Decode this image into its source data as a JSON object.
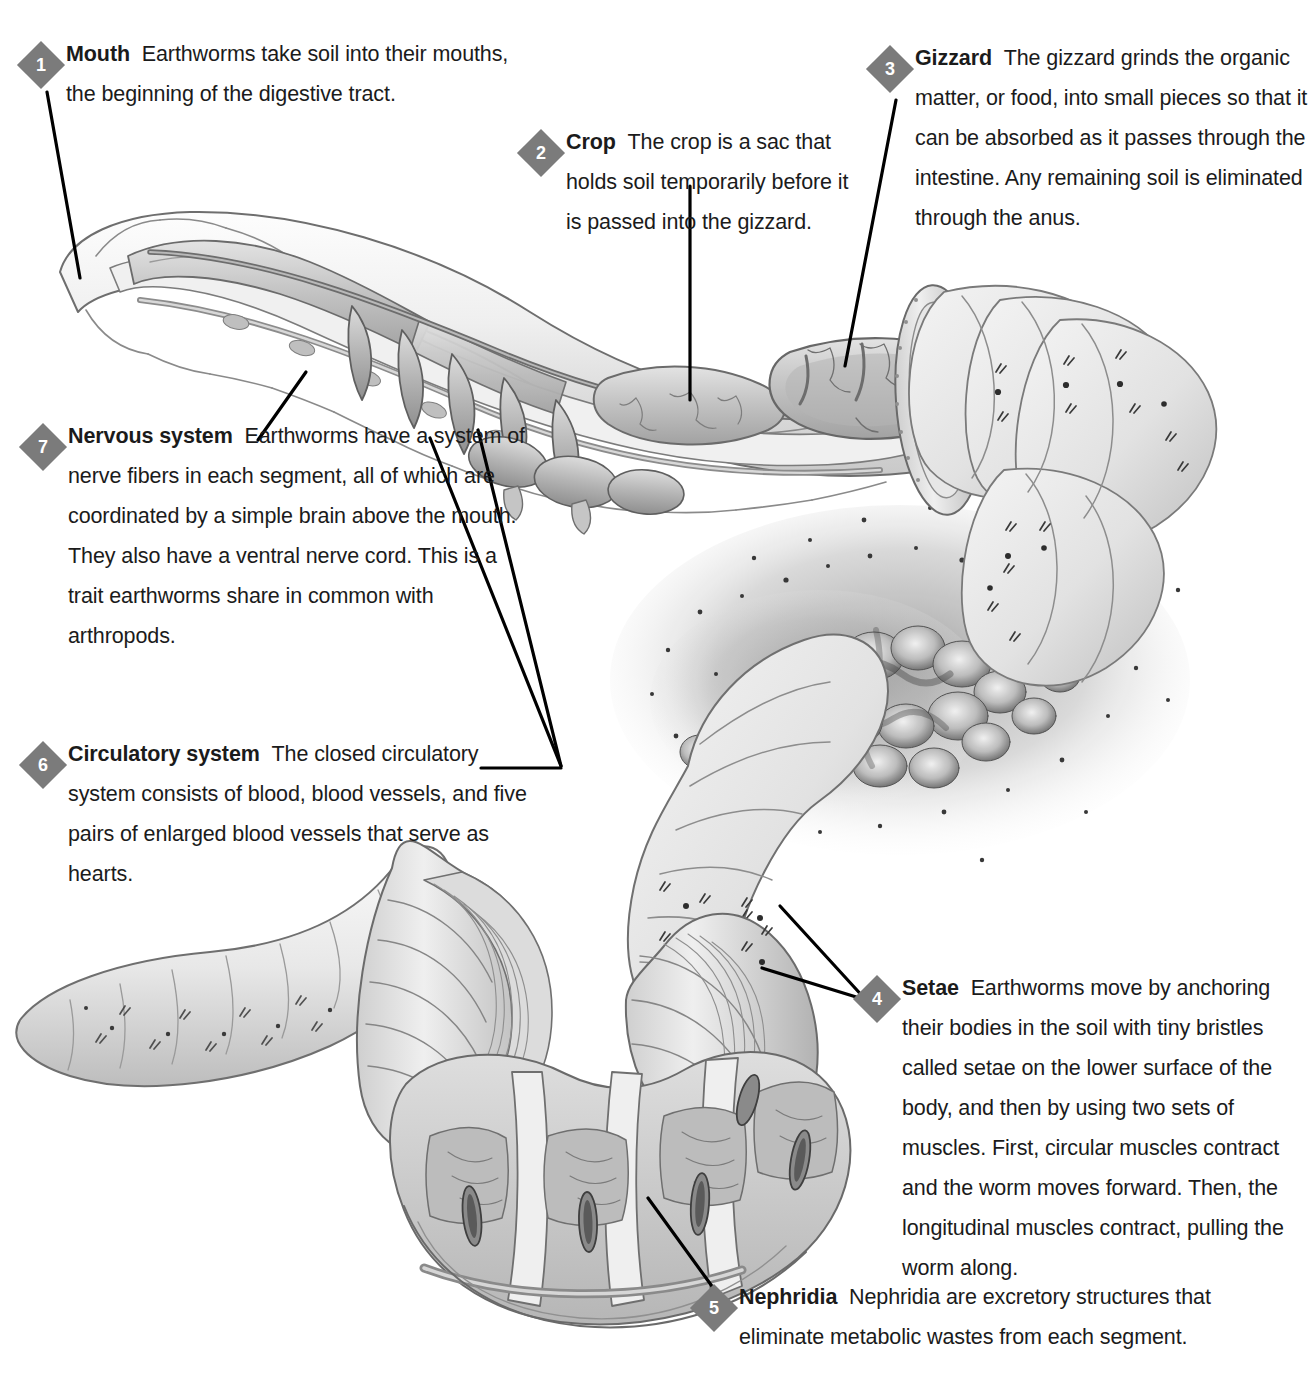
{
  "figure": {
    "background_color": "#ffffff",
    "badge_color": "#7b7b7b",
    "badge_text_color": "#ffffff",
    "text_color": "#1b1b1b",
    "leader_line_color": "#000000"
  },
  "callouts": [
    {
      "number": "1",
      "term": "Mouth",
      "desc": "Earthworms take soil into their mouths, the beginning of the digestive tract."
    },
    {
      "number": "2",
      "term": "Crop",
      "desc": "The crop is a sac that holds soil temporarily before it is passed into the gizzard."
    },
    {
      "number": "3",
      "term": "Gizzard",
      "desc": "The gizzard grinds the organic matter, or food, into small pieces so that it can be absorbed as it passes through the intestine. Any remaining soil is eliminated through the anus."
    },
    {
      "number": "4",
      "term": "Setae",
      "desc": "Earthworms move by anchoring their bodies in the soil with tiny bristles called setae on the lower surface of the body, and then by using two sets of muscles. First, circular muscles contract and the worm moves forward. Then, the longitudinal muscles contract, pulling the worm along."
    },
    {
      "number": "5",
      "term": "Nephridia",
      "desc": "Nephridia are excretory structures that eliminate metabolic wastes from each segment."
    },
    {
      "number": "6",
      "term": "Circulatory system",
      "desc": "The closed circulatory system consists of blood, blood vessels, and five pairs of enlarged blood vessels that serve as hearts."
    },
    {
      "number": "7",
      "term": "Nervous system",
      "desc": "Earthworms have a system of nerve fibers in each segment, all of which are coordinated by a simple brain above the mouth. They also have a ventral nerve cord. This is a trait earthworms share in common with arthropods."
    }
  ]
}
